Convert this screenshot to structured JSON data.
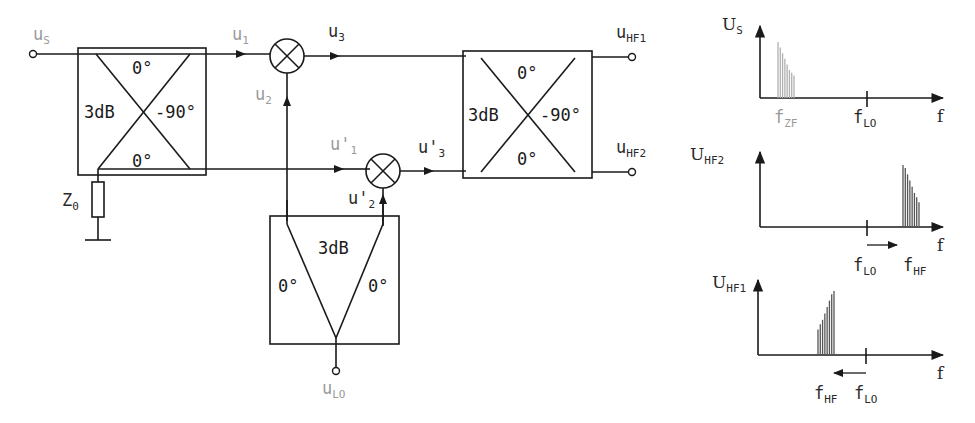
{
  "colors": {
    "line": "#1a1a1a",
    "label": "#2a2a2a",
    "grey_label": "#9a9a9a",
    "spectrum_grey": "#b0b0b0",
    "spectrum_dark": "#555555"
  },
  "signals": {
    "us": {
      "main": "u",
      "sub": "S"
    },
    "u1": {
      "main": "u",
      "sub": "1"
    },
    "u2": {
      "main": "u",
      "sub": "2"
    },
    "u3": {
      "main": "u",
      "sub": "3"
    },
    "u1p": {
      "main": "u'",
      "sub": "1"
    },
    "u2p": {
      "main": "u'",
      "sub": "2"
    },
    "u3p": {
      "main": "u'",
      "sub": "3"
    },
    "uhf1": {
      "main": "u",
      "sub": "HF1"
    },
    "uhf2": {
      "main": "u",
      "sub": "HF2"
    },
    "ulo": {
      "main": "u",
      "sub": "LO"
    }
  },
  "hybrid_left": {
    "attenuation": "3dB",
    "phase_top": "0°",
    "phase_right": "-90°",
    "phase_bottom": "0°"
  },
  "hybrid_right": {
    "attenuation": "3dB",
    "phase_top": "0°",
    "phase_right": "-90°",
    "phase_bottom": "0°"
  },
  "splitter": {
    "attenuation": "3dB",
    "phase_left": "0°",
    "phase_right": "0°"
  },
  "termination": {
    "main": "Z",
    "sub": "0"
  },
  "spectra": [
    {
      "name": "input-spectrum",
      "ylabel": {
        "main": "U",
        "sub": "S"
      },
      "xlabel": "f",
      "ticks": [
        {
          "main": "f",
          "sub": "ZF",
          "grey": true
        },
        {
          "main": "f",
          "sub": "LO",
          "grey": false
        }
      ],
      "band_heights": [
        1.0,
        0.9,
        0.8,
        0.7,
        0.6,
        0.5,
        0.45,
        0.4
      ],
      "band_position": "low",
      "shift_arrow": "none"
    },
    {
      "name": "hf2-spectrum",
      "ylabel": {
        "main": "U",
        "sub": "HF2"
      },
      "xlabel": "f",
      "ticks": [
        {
          "main": "f",
          "sub": "LO"
        },
        {
          "main": "f",
          "sub": "HF"
        }
      ],
      "band_heights": [
        1.0,
        0.95,
        0.85,
        0.75,
        0.65,
        0.55,
        0.48,
        0.4
      ],
      "band_position": "above-lo",
      "shift_arrow": "right"
    },
    {
      "name": "hf1-spectrum",
      "ylabel": {
        "main": "U",
        "sub": "HF1"
      },
      "xlabel": "f",
      "ticks": [
        {
          "main": "f",
          "sub": "HF"
        },
        {
          "main": "f",
          "sub": "LO"
        }
      ],
      "band_heights": [
        0.4,
        0.48,
        0.55,
        0.65,
        0.75,
        0.85,
        0.95,
        1.0
      ],
      "band_position": "below-lo",
      "shift_arrow": "left"
    }
  ]
}
